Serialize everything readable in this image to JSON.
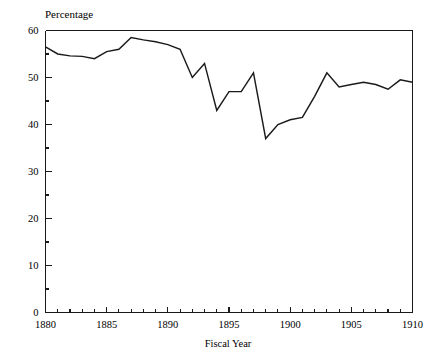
{
  "chart_data": {
    "type": "line",
    "title": "Percentage",
    "xlabel": "Fiscal Year",
    "ylabel": "Percentage",
    "grid": false,
    "legend": false,
    "legend_position": "none",
    "xlim": [
      1880,
      1910
    ],
    "ylim": [
      0,
      60
    ],
    "x_major_ticks": [
      1880,
      1885,
      1890,
      1895,
      1900,
      1905,
      1910
    ],
    "x_major_tick_labels": [
      "1880",
      "1885",
      "1890",
      "1895",
      "1900",
      "1905",
      "1910"
    ],
    "x_minor_tick_interval": 1,
    "y_major_ticks": [
      0,
      10,
      20,
      30,
      40,
      50,
      60
    ],
    "y_major_tick_labels": [
      "0",
      "10",
      "20",
      "30",
      "40",
      "50",
      "60"
    ],
    "y_minor_ticks": [
      5,
      15,
      25,
      35,
      45,
      55
    ],
    "line_color": "#1a1a1a",
    "x": [
      1880,
      1881,
      1882,
      1883,
      1884,
      1885,
      1886,
      1887,
      1888,
      1889,
      1890,
      1891,
      1892,
      1893,
      1894,
      1895,
      1896,
      1897,
      1898,
      1899,
      1900,
      1901,
      1902,
      1903,
      1904,
      1905,
      1906,
      1907,
      1908,
      1909,
      1910
    ],
    "values": [
      56.5,
      55.0,
      54.6,
      54.5,
      54.0,
      55.5,
      56.0,
      58.5,
      58.0,
      57.6,
      57.0,
      56.0,
      50.0,
      53.0,
      43.0,
      47.0,
      47.0,
      51.0,
      37.0,
      40.0,
      41.0,
      41.5,
      46.0,
      51.0,
      48.0,
      48.5,
      49.0,
      48.5,
      47.5,
      49.5,
      49.0
    ],
    "series": [
      {
        "name": "Percentage",
        "values": [
          56.5,
          55.0,
          54.6,
          54.5,
          54.0,
          55.5,
          56.0,
          58.5,
          58.0,
          57.6,
          57.0,
          56.0,
          50.0,
          53.0,
          43.0,
          47.0,
          47.0,
          51.0,
          37.0,
          40.0,
          41.0,
          41.5,
          46.0,
          51.0,
          48.0,
          48.5,
          49.0,
          48.5,
          47.5,
          49.5,
          49.0
        ]
      }
    ]
  }
}
